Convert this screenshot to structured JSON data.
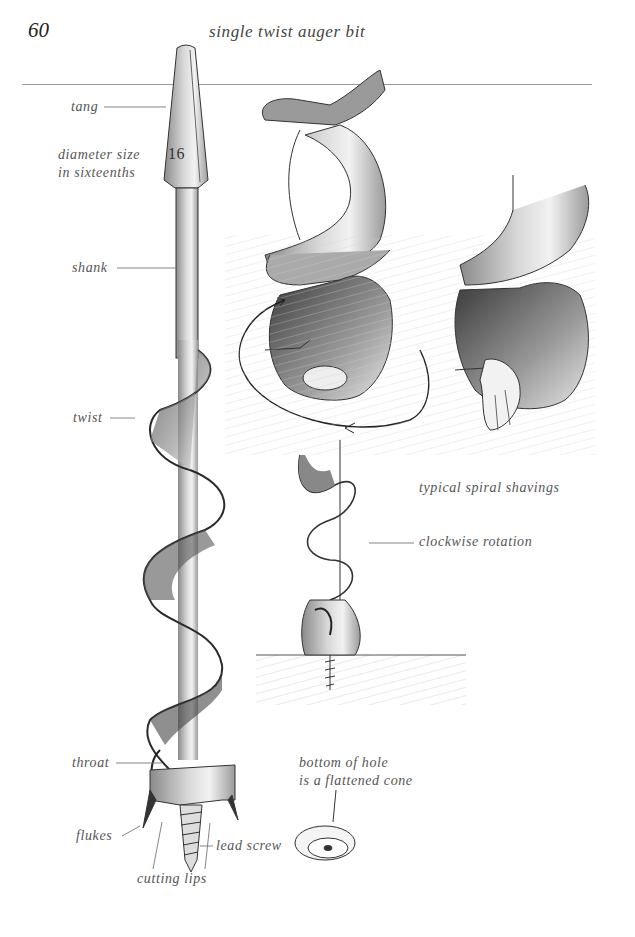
{
  "page": {
    "number": "60",
    "title": "single twist auger bit"
  },
  "labels": {
    "tang": "tang",
    "diameter_line1": "diameter size",
    "diameter_line2": "in sixteenths",
    "size_marking": "16",
    "shank": "shank",
    "twist": "twist",
    "throat": "throat",
    "flukes": "flukes",
    "lead_screw": "lead screw",
    "cutting_lips": "cutting lips",
    "hole_line1": "bottom of hole",
    "hole_line2": "is a flattened cone",
    "shavings": "typical spiral shavings",
    "rotation": "clockwise rotation"
  },
  "illustrations": [
    "main-auger-bit",
    "auger-twist-closeup-with-rotation-arrow",
    "auger-twist-closeup-with-shaving",
    "auger-boring-into-wood",
    "hole-bottom-cone"
  ]
}
